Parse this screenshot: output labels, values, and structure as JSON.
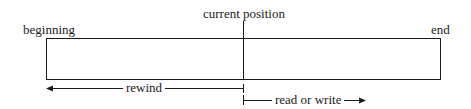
{
  "diagram": {
    "labels": {
      "current_position": "current position",
      "beginning": "beginning",
      "end": "end",
      "rewind": "rewind",
      "read_or_write": "read or write"
    },
    "colors": {
      "stroke": "#1a1a1a",
      "background": "#ffffff"
    }
  }
}
